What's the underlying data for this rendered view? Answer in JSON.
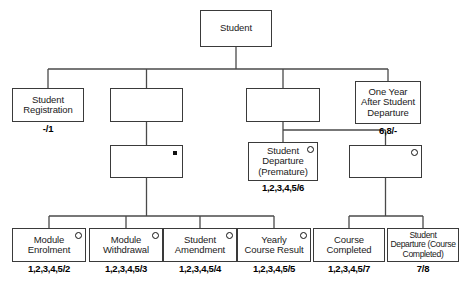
{
  "diagram": {
    "line_color": "#4a4a4a",
    "box_border_color": "#3a3a3a",
    "markers": {
      "selection": "selection-circle-marker",
      "iteration": "iteration-asterisk-marker"
    },
    "nodes": [
      {
        "id": "root",
        "label": "Student",
        "caption": "",
        "marker": "",
        "x": 200,
        "y": 10,
        "w": 72,
        "h": 37,
        "small": false
      },
      {
        "id": "registration",
        "label": "Student\nRegistration",
        "caption": "-/1",
        "marker": "",
        "x": 12,
        "y": 88,
        "w": 72,
        "h": 34,
        "small": false
      },
      {
        "id": "mid-left",
        "label": "",
        "caption": "",
        "marker": "",
        "x": 110,
        "y": 88,
        "w": 73,
        "h": 34,
        "small": false
      },
      {
        "id": "mid-right",
        "label": "",
        "caption": "",
        "marker": "",
        "x": 246,
        "y": 88,
        "w": 74,
        "h": 34,
        "small": false
      },
      {
        "id": "one-year",
        "label": "One Year\nAfter Student\nDeparture",
        "caption": "6,8/-",
        "marker": "",
        "x": 355,
        "y": 81,
        "w": 66,
        "h": 43,
        "small": false
      },
      {
        "id": "iteration-box",
        "label": "",
        "caption": "",
        "marker": "iteration",
        "x": 110,
        "y": 145,
        "w": 73,
        "h": 33,
        "small": false
      },
      {
        "id": "dep-premature",
        "label": "Student\nDeparture\n(Premature)",
        "caption": "1,2,3,4,5/6",
        "marker": "selection",
        "x": 248,
        "y": 142,
        "w": 70,
        "h": 39,
        "small": false
      },
      {
        "id": "selection-box",
        "label": "",
        "caption": "",
        "marker": "selection",
        "x": 349,
        "y": 145,
        "w": 73,
        "h": 33,
        "small": false
      },
      {
        "id": "module-enrol",
        "label": "Module\nEnrolment",
        "caption": "1,2,3,4,5/2",
        "marker": "selection",
        "x": 12,
        "y": 228,
        "w": 74,
        "h": 34,
        "small": false
      },
      {
        "id": "module-withdraw",
        "label": "Module\nWithdrawal",
        "caption": "1,2,3,4,5/3",
        "marker": "selection",
        "x": 89,
        "y": 228,
        "w": 74,
        "h": 34,
        "small": false
      },
      {
        "id": "stu-amend",
        "label": "Student\nAmendment",
        "caption": "1,2,3,4,5/4",
        "marker": "selection",
        "x": 163,
        "y": 228,
        "w": 74,
        "h": 34,
        "small": false
      },
      {
        "id": "yearly-result",
        "label": "Yearly\nCourse Result",
        "caption": "1,2,3,4,5/5",
        "marker": "selection",
        "x": 237,
        "y": 228,
        "w": 74,
        "h": 34,
        "small": false
      },
      {
        "id": "course-complete",
        "label": "Course\nCompleted",
        "caption": "1,2,3,4,5/7",
        "marker": "",
        "x": 313,
        "y": 228,
        "w": 72,
        "h": 34,
        "small": false
      },
      {
        "id": "dep-completed",
        "label": "Student\nDeparture (Course\nCompleted)",
        "caption": "7/8",
        "marker": "",
        "x": 387,
        "y": 228,
        "w": 72,
        "h": 34,
        "small": true
      }
    ],
    "connectors": [
      {
        "from": "root",
        "to": "registration",
        "kind": "tree"
      },
      {
        "from": "root",
        "to": "mid-left",
        "kind": "tree"
      },
      {
        "from": "root",
        "to": "mid-right",
        "kind": "tree"
      },
      {
        "from": "root",
        "to": "one-year",
        "kind": "tree"
      },
      {
        "from": "mid-left",
        "to": "iteration-box",
        "kind": "straight"
      },
      {
        "from": "mid-right",
        "to": "dep-premature",
        "kind": "tree"
      },
      {
        "from": "mid-right",
        "to": "selection-box",
        "kind": "tree"
      },
      {
        "from": "iteration-box",
        "to": "module-enrol",
        "kind": "tree"
      },
      {
        "from": "iteration-box",
        "to": "module-withdraw",
        "kind": "tree"
      },
      {
        "from": "iteration-box",
        "to": "stu-amend",
        "kind": "tree"
      },
      {
        "from": "iteration-box",
        "to": "yearly-result",
        "kind": "tree"
      },
      {
        "from": "selection-box",
        "to": "course-complete",
        "kind": "tree"
      },
      {
        "from": "selection-box",
        "to": "dep-completed",
        "kind": "tree"
      }
    ]
  }
}
